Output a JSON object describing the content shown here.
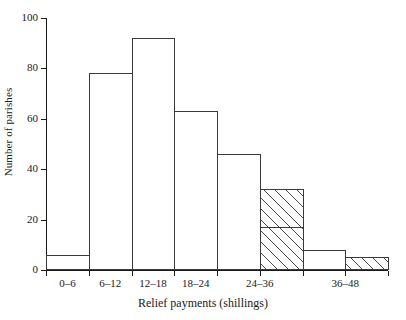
{
  "chart_data": {
    "type": "bar",
    "title": "",
    "subtitle": "",
    "xlabel": "Relief payments (shillings)",
    "ylabel": "Number of parishes",
    "categories": [
      "0–6",
      "6–12",
      "12–18",
      "18–24",
      "24–36",
      "36–48"
    ],
    "bin_edges": [
      0,
      6,
      12,
      18,
      24,
      30,
      36,
      42,
      48
    ],
    "xlim": [
      0,
      48
    ],
    "ylim": [
      0,
      100
    ],
    "yticks": [
      0,
      20,
      40,
      60,
      80,
      100
    ],
    "ytick_labels": [
      "0",
      "20",
      "40",
      "60",
      "80",
      "100"
    ],
    "xtick_values": [
      0,
      6,
      12,
      18,
      24,
      30,
      36,
      42,
      48
    ],
    "grid": false,
    "legend": false,
    "series": [
      {
        "name": "outline",
        "style": "white-outline",
        "bins": [
          {
            "from": 0,
            "to": 6,
            "value": 6
          },
          {
            "from": 6,
            "to": 12,
            "value": 78
          },
          {
            "from": 12,
            "to": 18,
            "value": 92
          },
          {
            "from": 18,
            "to": 24,
            "value": 63
          },
          {
            "from": 24,
            "to": 30,
            "value": 46
          },
          {
            "from": 36,
            "to": 42,
            "value": 8
          }
        ]
      },
      {
        "name": "hatched",
        "style": "diagonal-hatch",
        "bins": [
          {
            "from": 24,
            "to": 30,
            "value": 32
          },
          {
            "from": 30,
            "to": 36,
            "value": 32
          },
          {
            "from": 36,
            "to": 42,
            "value": 5
          },
          {
            "from": 42,
            "to": 48,
            "value": 5
          }
        ]
      },
      {
        "name": "inner-step",
        "style": "inner-line",
        "bins": [
          {
            "from": 30,
            "to": 36,
            "value": 17
          }
        ]
      }
    ]
  },
  "axes": {
    "y_label": "Number of parishes",
    "x_label": "Relief payments (shillings)",
    "y_tick_labels": [
      "100",
      "80",
      "60",
      "40",
      "20",
      "0"
    ],
    "x_tick_labels": [
      "0–6",
      "6–12",
      "12–18",
      "18–24",
      "24–36",
      "36–48"
    ]
  }
}
